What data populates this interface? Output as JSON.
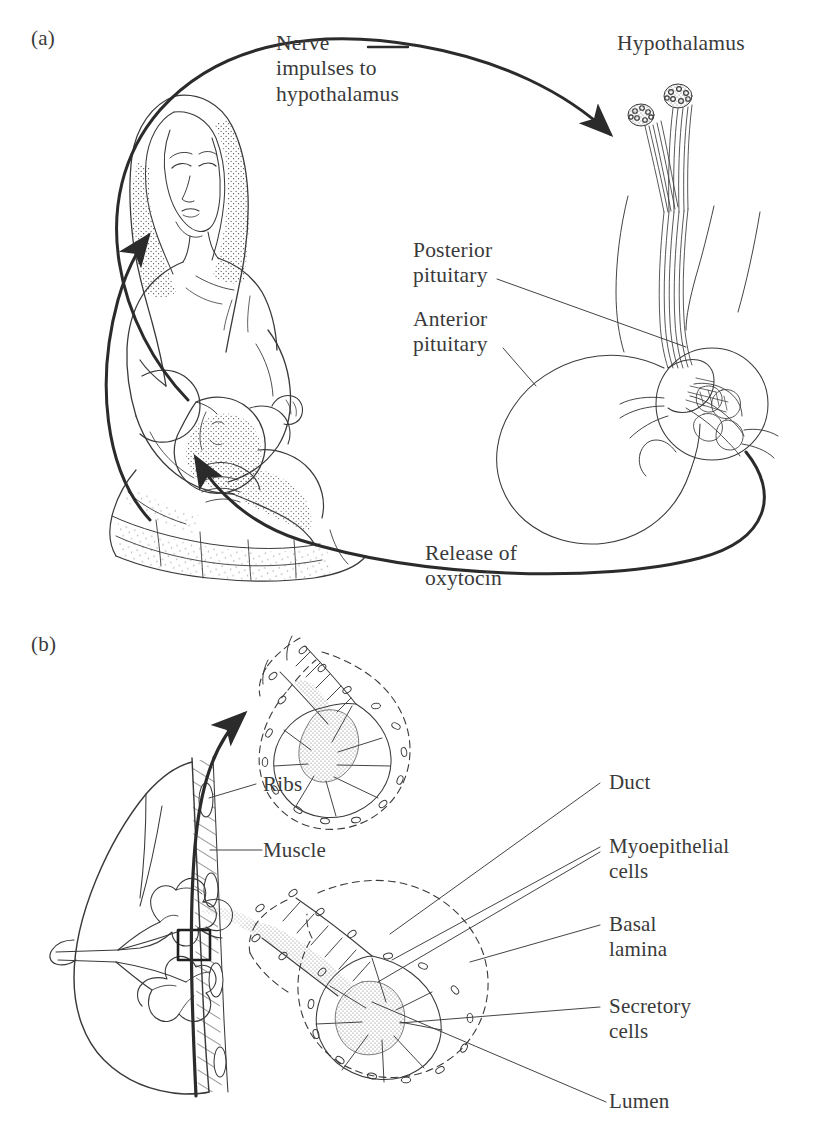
{
  "figure": {
    "background_color": "#ffffff",
    "ink_color": "#3a3a3a",
    "heavy_ink_color": "#2b2b2b"
  },
  "panels": [
    {
      "id": "a",
      "mark": "(a)",
      "title": "Neuroendocrine milk ejection reflex"
    },
    {
      "id": "b",
      "mark": "(b)",
      "title": "Mammary alveolus structure"
    }
  ],
  "panel_a": {
    "mark": "(a)",
    "labels": {
      "nerve_impulses": "Nerve\nimpulses to\nhypothalamus",
      "hypothalamus": "Hypothalamus",
      "posterior_pituitary": "Posterior\npituitary",
      "anterior_pituitary": "Anterior\npituitary",
      "release_of_oxytocin": "Release of\noxytocin"
    },
    "flow": [
      {
        "from": "suckling infant",
        "to": "hypothalamus",
        "label": "Nerve impulses to hypothalamus"
      },
      {
        "from": "posterior pituitary",
        "to": "breast",
        "label": "Release of oxytocin"
      }
    ],
    "scene": "Mother seated, holding and breastfeeding an infant; to the right a sagittal drawing of hypothalamic neurosecretory nuclei with axons descending through the infundibulum to the pituitary gland."
  },
  "panel_b": {
    "mark": "(b)",
    "labels": {
      "ribs": "Ribs",
      "muscle": "Muscle",
      "duct": "Duct",
      "myoepithelial_cells": "Myoepithelial\ncells",
      "basal_lamina": "Basal\nlamina",
      "secretory_cells": "Secretory\ncells",
      "lumen": "Lumen"
    },
    "scene": "Sagittal section of the breast against the ribs and pectoral muscle, with a small boxed region of glandular tissue magnified twice: an upper contracted alveolus ejecting milk, and a lower distended alveolus filled with milk."
  },
  "caption": ""
}
